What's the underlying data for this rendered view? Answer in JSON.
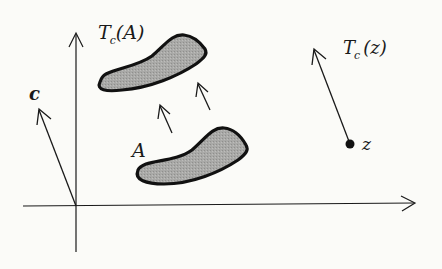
{
  "diagram": {
    "colors": {
      "background": "#fbfbf8",
      "stroke": "#1a1a1a",
      "blob_fill": "#a8a8a6"
    },
    "labels": {
      "set_translated": {
        "main": "T",
        "sub": "c",
        "arg": "(A)"
      },
      "set_original": "A",
      "vector": "c",
      "point_translated": {
        "main": "T",
        "sub": "c",
        "arg": "(z)"
      },
      "point_original": "z"
    },
    "axes": {
      "origin": [
        76,
        206
      ],
      "x_axis": {
        "from": [
          23,
          206
        ],
        "to": [
          415,
          203
        ]
      },
      "y_axis": {
        "from": [
          76,
          252
        ],
        "to": [
          76,
          33
        ]
      }
    },
    "vector_c": {
      "from": [
        76,
        206
      ],
      "to": [
        39,
        109
      ]
    },
    "translation_arrows": [
      {
        "from": [
          172,
          133
        ],
        "to": [
          160,
          105
        ]
      },
      {
        "from": [
          210,
          110
        ],
        "to": [
          198,
          83
        ]
      }
    ],
    "point_z": {
      "at": [
        350,
        144
      ],
      "arrow_to": [
        314,
        49
      ]
    }
  }
}
